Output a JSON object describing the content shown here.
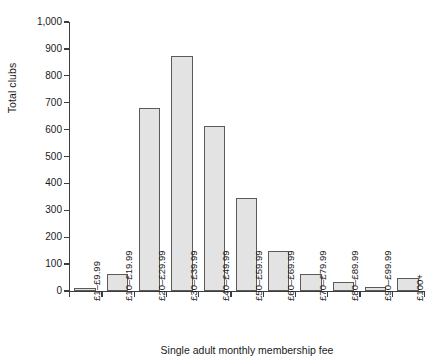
{
  "chart_data": {
    "type": "bar",
    "title": "",
    "xlabel": "Single adult monthly membership fee",
    "ylabel": "Total clubs",
    "ylim": [
      0,
      1000
    ],
    "ytick_labels": [
      "1,000",
      "900",
      "800",
      "700",
      "600",
      "500",
      "400",
      "300",
      "200",
      "100",
      "0"
    ],
    "ytick_values": [
      1000,
      900,
      800,
      700,
      600,
      500,
      400,
      300,
      200,
      100,
      0
    ],
    "grid": false,
    "legend": null,
    "bar_fill_color": "#e3e3e3",
    "bar_edge_color": "#5a5a5a",
    "axis_color": "#3d3d3d",
    "categories": [
      "£1–£9.99",
      "£10–£19.99",
      "£20–£29.99",
      "£30–£39.99",
      "£40–£49.99",
      "£50–£59.99",
      "£60–£69.99",
      "£70–£79.99",
      "£80–£89.99",
      "£90–£99.99",
      "£100+"
    ],
    "values": [
      10,
      65,
      680,
      875,
      615,
      345,
      150,
      65,
      33,
      15,
      50
    ]
  }
}
